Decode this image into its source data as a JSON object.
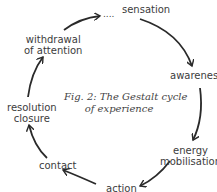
{
  "diagram": {
    "caption_line1": "Fig. 2: The Gestalt cycle",
    "caption_line2": "of experience",
    "stages": {
      "sensation": "sensation",
      "awareness": "awareness",
      "energy_line1": "energy",
      "energy_line2": "mobilisation",
      "action": "action",
      "contact": "contact",
      "resolution_line1": "resolution",
      "resolution_line2": "closure",
      "withdrawal_line1": "withdrawal",
      "withdrawal_line2": "of attention"
    },
    "ellipsis": "....",
    "arrow_color": "#2a2a2a"
  }
}
